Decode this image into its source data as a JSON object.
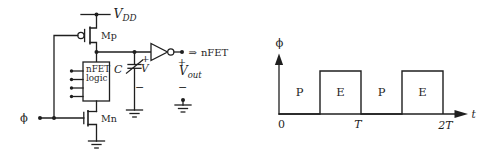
{
  "colors": {
    "ink": "#1f1f1f",
    "background": "#ffffff"
  },
  "circuit": {
    "supply": {
      "base": "V",
      "sub": "DD"
    },
    "pmos_label": "Mp",
    "nmos_label": "Mn",
    "logic_block": {
      "line1": "nFET",
      "line2": "logic"
    },
    "clock_label": "ϕ",
    "capacitor": {
      "name": "C",
      "plus": "+",
      "voltage": "V",
      "minus": "−"
    },
    "inverter_output": {
      "arrow": "⇒",
      "load_label": "nFET",
      "plus": "+",
      "v_base": "V",
      "v_sub": "out",
      "minus": "−"
    }
  },
  "waveform": {
    "type": "line",
    "y_axis_label": "ϕ",
    "x_axis_label": "t",
    "tick_labels": {
      "origin": "0",
      "t1": "T",
      "t2": "2T"
    },
    "phase_labels": [
      "P",
      "E",
      "P",
      "E"
    ],
    "signal_steps": [
      {
        "phase": "P",
        "interval": "0 to T/2",
        "level": 0
      },
      {
        "phase": "E",
        "interval": "T/2 to T",
        "level": 1
      },
      {
        "phase": "P",
        "interval": "T to 3T/2",
        "level": 0
      },
      {
        "phase": "E",
        "interval": "3T/2 to 2T",
        "level": 1
      }
    ]
  }
}
